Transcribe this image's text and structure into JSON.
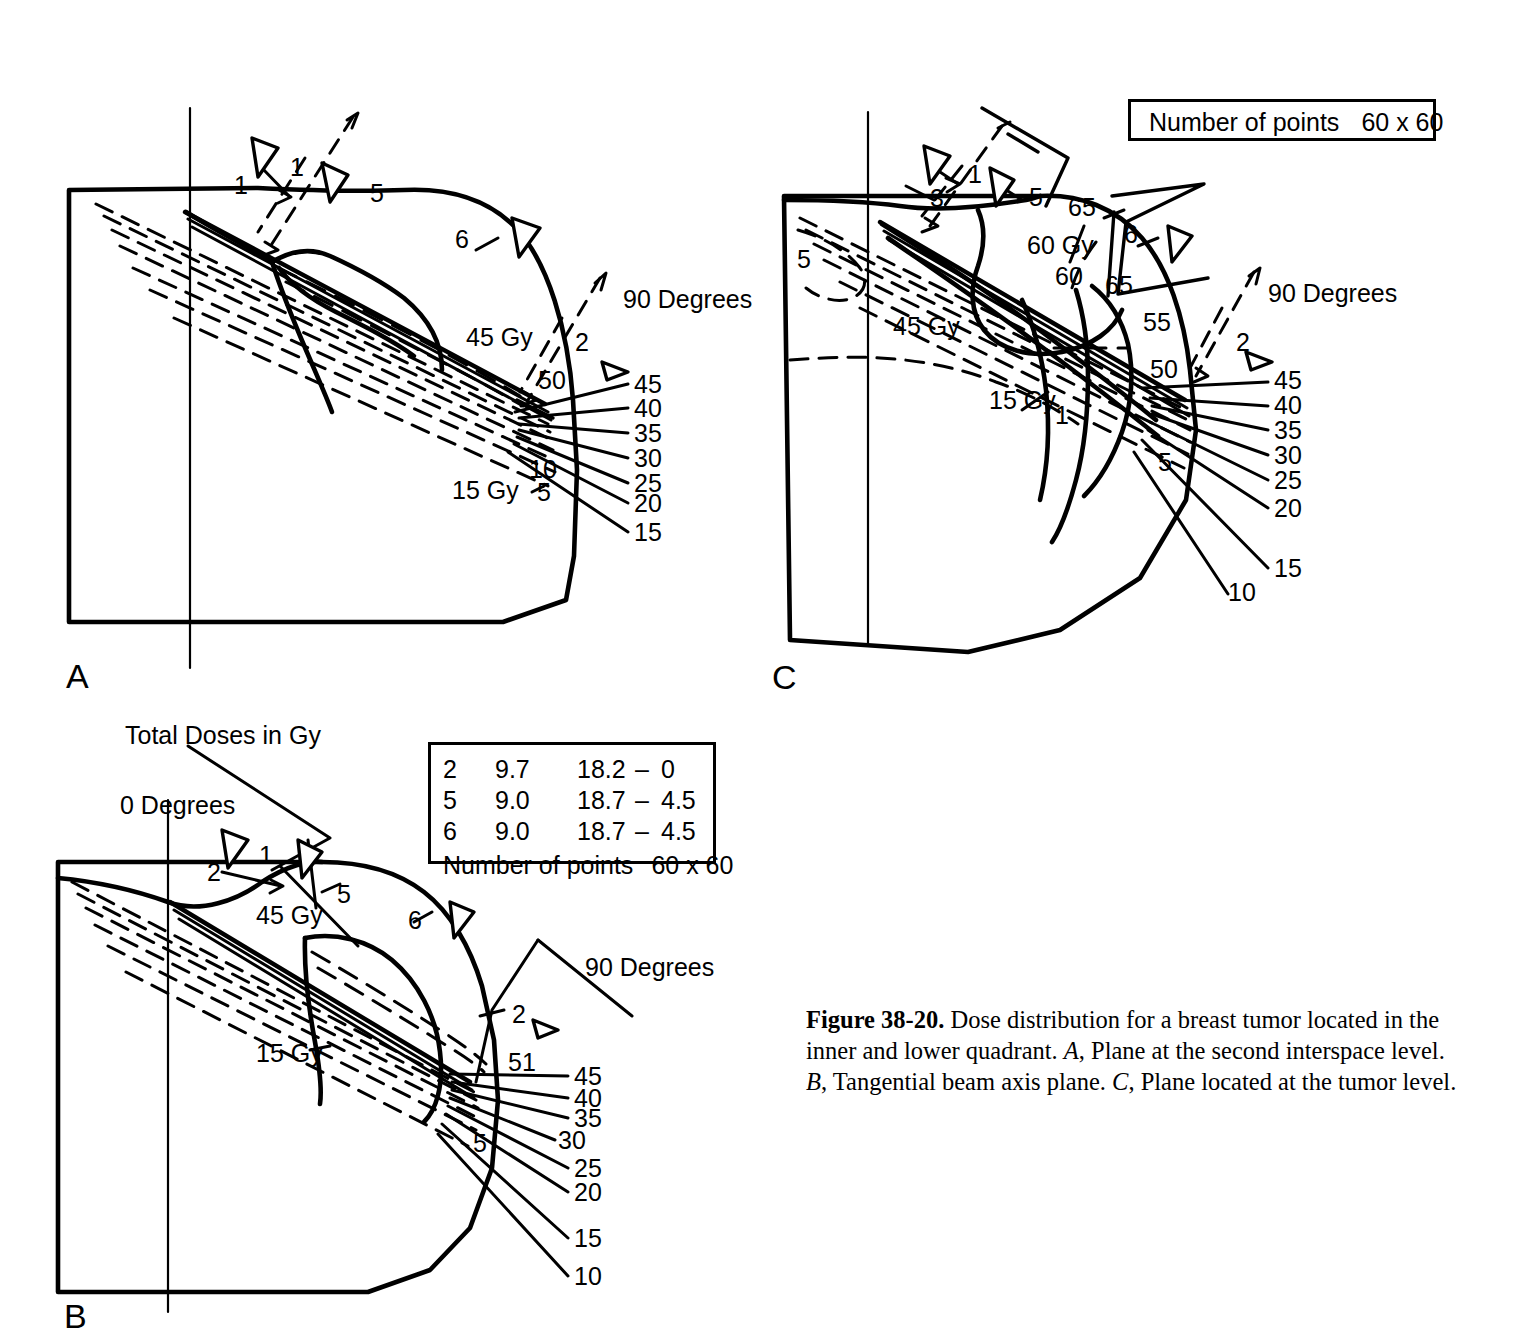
{
  "figure": {
    "id": "Figure 38-20.",
    "caption_text": " Dose distribution for a breast tumor located in the inner and lower quadrant. ",
    "caption_a_letter": "A",
    "caption_a_text": ", Plane at the second interspace level. ",
    "caption_b_letter": "B",
    "caption_b_text": ", Tangential beam axis plane. ",
    "caption_c_letter": "C",
    "caption_c_text": ", Plane located at the tumor level."
  },
  "panels": {
    "a": {
      "letter": "A",
      "degrees_label": "90 Degrees",
      "contour_45": "45 Gy",
      "contour_15": "15 Gy",
      "beam_1a": "1",
      "beam_1b": "1",
      "beam_5": "5",
      "beam_6": "6",
      "beam_2": "2",
      "hot_50": "50",
      "low_10": "10",
      "low_5": "5",
      "leaders": [
        "45",
        "40",
        "35",
        "30",
        "25",
        "20",
        "15"
      ]
    },
    "b": {
      "letter": "B",
      "title": "Total Doses in Gy",
      "degrees_0": "0 Degrees",
      "degrees_90": "90 Degrees",
      "contour_45": "45 Gy",
      "contour_15": "15 Gy",
      "beam_1": "1",
      "beam_2_top": "2",
      "beam_5_top": "5",
      "beam_6": "6",
      "beam_2_right": "2",
      "hot_51": "51",
      "low_5": "5",
      "leaders": [
        "45",
        "40",
        "35",
        "30",
        "25",
        "20",
        "15",
        "10"
      ]
    },
    "c": {
      "letter": "C",
      "degrees_label": "90 Degrees",
      "contour_45": "45 Gy",
      "contour_15": "15 Gy",
      "contour_60": "60 Gy",
      "beam_1": "1",
      "beam_3": "3",
      "beam_5_top": "5",
      "beam_6": "6",
      "beam_2": "2",
      "iso_65_upper": "65",
      "iso_60": "60",
      "iso_65_lower": "65",
      "iso_55": "55",
      "iso_50": "50",
      "low_5_left": "5",
      "low_1": "1",
      "low_5_right": "5",
      "leaders": [
        "45",
        "40",
        "35",
        "30",
        "25",
        "20",
        "15",
        "10"
      ]
    }
  },
  "table_box": {
    "rows": [
      {
        "beam": "2",
        "col2": "9.7",
        "col3": "18.2",
        "dash": "–",
        "col4": "0"
      },
      {
        "beam": "5",
        "col2": "9.0",
        "col3": "18.7",
        "dash": "–",
        "col4": "4.5"
      },
      {
        "beam": "6",
        "col2": "9.0",
        "col3": "18.7",
        "dash": "–",
        "col4": "4.5"
      }
    ],
    "points_label": "Number of points",
    "points_value": "60 x 60"
  },
  "points_box_c": {
    "points_label": "Number of points",
    "points_value": "60 x 60"
  },
  "colors": {
    "ink": "#000000",
    "paper": "#ffffff"
  }
}
